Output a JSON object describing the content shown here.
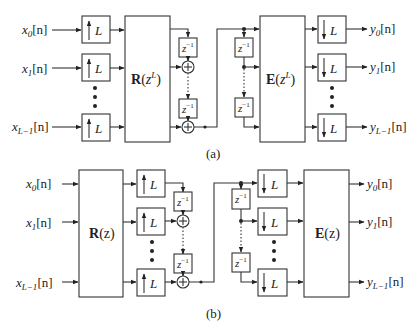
{
  "panel_a": {
    "caption": "(a)",
    "inputs": [
      {
        "base": "x",
        "sub": "0",
        "arg": "[n]"
      },
      {
        "base": "x",
        "sub": "1",
        "arg": "[n]"
      },
      {
        "base": "x",
        "sub": "L−1",
        "arg": "[n]"
      }
    ],
    "upsampler_label": "L",
    "polyphase_R": {
      "bold": "R",
      "arg_open": "(",
      "var": "z",
      "sup": "L",
      "arg_close": ")"
    },
    "delay_label": {
      "base": "z",
      "sup": "−1"
    },
    "polyphase_E": {
      "bold": "E",
      "arg_open": "(",
      "var": "z",
      "sup": "L",
      "arg_close": ")"
    },
    "downsampler_label": "L",
    "outputs": [
      {
        "base": "y",
        "sub": "0",
        "arg": "[n]"
      },
      {
        "base": "y",
        "sub": "1",
        "arg": "[n]"
      },
      {
        "base": "y",
        "sub": "L−1",
        "arg": "[n]"
      }
    ]
  },
  "panel_b": {
    "caption": "(b)",
    "inputs": [
      {
        "base": "x",
        "sub": "0",
        "arg": "[n]"
      },
      {
        "base": "x",
        "sub": "1",
        "arg": "[n]"
      },
      {
        "base": "x",
        "sub": "L−1",
        "arg": "[n]"
      }
    ],
    "polyphase_R": {
      "bold": "R",
      "arg": "(z)"
    },
    "upsampler_label": "L",
    "delay_label": {
      "base": "z",
      "sup": "−1"
    },
    "downsampler_label": "L",
    "polyphase_E": {
      "bold": "E",
      "arg": "(z)"
    },
    "outputs": [
      {
        "base": "y",
        "sub": "0",
        "arg": "[n]"
      },
      {
        "base": "y",
        "sub": "1",
        "arg": "[n]"
      },
      {
        "base": "y",
        "sub": "L−1",
        "arg": "[n]"
      }
    ]
  }
}
